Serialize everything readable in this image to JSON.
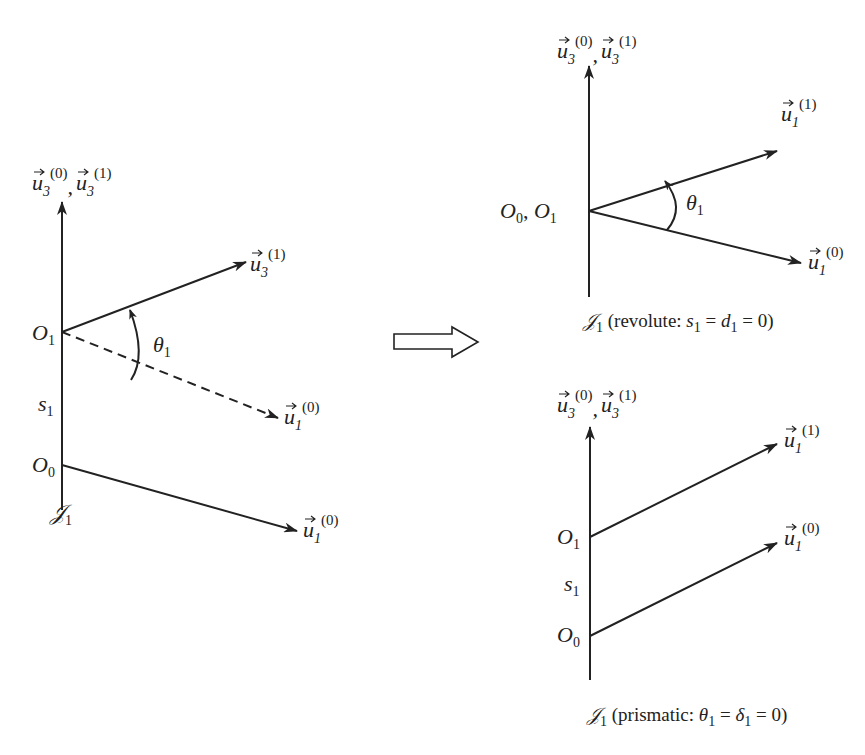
{
  "figure": {
    "left_panel": {
      "axis_label": {
        "vec": "u",
        "sub": "3",
        "sup_a": "(0)",
        "sup_b": "(1)",
        "sep": ","
      },
      "rotated_vector": {
        "vec": "u",
        "sub": "3",
        "sup": "(1)"
      },
      "dashed_vector": {
        "vec": "u",
        "sub": "1",
        "sup": "(0)"
      },
      "base_vector": {
        "vec": "u",
        "sub": "1",
        "sup": "(0)"
      },
      "angle": {
        "sym": "θ",
        "sub": "1"
      },
      "offset": {
        "sym": "s",
        "sub": "1"
      },
      "origin_1": {
        "sym": "O",
        "sub": "1"
      },
      "origin_0": {
        "sym": "O",
        "sub": "0"
      },
      "joint": {
        "sym": "𝒥",
        "sub": "1"
      }
    },
    "transform_arrow": {
      "icon": "hollow-right-arrow"
    },
    "revolute_panel": {
      "axis_label": {
        "vec": "u",
        "sub": "3",
        "sup_a": "(0)",
        "sup_b": "(1)",
        "sep": ","
      },
      "rotated_vector": {
        "vec": "u",
        "sub": "1",
        "sup": "(1)"
      },
      "base_vector": {
        "vec": "u",
        "sub": "1",
        "sup": "(0)"
      },
      "angle": {
        "sym": "θ",
        "sub": "1"
      },
      "origins": {
        "a": "O",
        "a_sub": "0",
        "sep": ", ",
        "b": "O",
        "b_sub": "1"
      },
      "caption": {
        "joint": "𝒥",
        "joint_sub": "1",
        "open": " (revolute: ",
        "s": "s",
        "s_sub": "1",
        "eq1": " = ",
        "d": "d",
        "d_sub": "1",
        "eq2": " = 0)"
      }
    },
    "prismatic_panel": {
      "axis_label": {
        "vec": "u",
        "sub": "3",
        "sup_a": "(0)",
        "sup_b": "(1)",
        "sep": ","
      },
      "upper_vector": {
        "vec": "u",
        "sub": "1",
        "sup": "(1)"
      },
      "lower_vector": {
        "vec": "u",
        "sub": "1",
        "sup": "(0)"
      },
      "offset": {
        "sym": "s",
        "sub": "1"
      },
      "origin_1": {
        "sym": "O",
        "sub": "1"
      },
      "origin_0": {
        "sym": "O",
        "sub": "0"
      },
      "caption": {
        "joint": "𝒥",
        "joint_sub": "1",
        "open": " (prismatic: ",
        "t": "θ",
        "t_sub": "1",
        "eq1": " = ",
        "dl": "δ",
        "dl_sub": "1",
        "eq2": " = 0)"
      }
    }
  }
}
